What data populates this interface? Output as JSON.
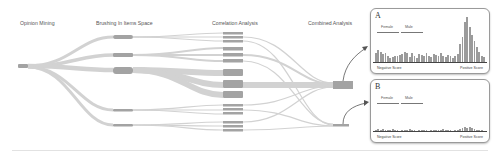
{
  "stages": [
    {
      "label": "Opinion Mining",
      "x": 20
    },
    {
      "label": "Brushing In Items Space",
      "x": 96
    },
    {
      "label": "Correlation Analysis",
      "x": 212
    },
    {
      "label": "Combined Analysis",
      "x": 308
    }
  ],
  "colors": {
    "flow": "#d2d2d2",
    "node": "#a3a3a3",
    "bar": "#9b9b9b",
    "axis": "#444444",
    "arrow": "#555555"
  },
  "panels": [
    {
      "id": "A",
      "letter": "A",
      "legend": {
        "female": "Female",
        "male": "Male"
      },
      "axis": {
        "negative": "Negative Score",
        "positive": "Positive Score"
      },
      "bars": [
        14,
        18,
        15,
        12,
        13,
        9,
        7,
        8,
        10,
        9,
        11,
        12,
        15,
        13,
        8,
        14,
        9,
        7,
        12,
        11,
        10,
        13,
        9,
        8,
        12,
        11,
        10,
        13,
        9,
        8,
        11,
        10,
        7,
        9,
        12,
        25,
        35,
        55,
        62,
        48,
        38,
        30,
        22,
        15,
        10,
        8
      ]
    },
    {
      "id": "B",
      "letter": "B",
      "legend": {
        "female": "Female",
        "male": "Male"
      },
      "axis": {
        "negative": "Negative Score",
        "positive": "Positive Score"
      },
      "bars": [
        7,
        9,
        6,
        8,
        7,
        5,
        6,
        8,
        6,
        5,
        4,
        6,
        7,
        5,
        8,
        6,
        5,
        4,
        7,
        6,
        5,
        6,
        4,
        5,
        7,
        6,
        5,
        6,
        8,
        7,
        5,
        6,
        4,
        5,
        6,
        9,
        12,
        14,
        11,
        15,
        12,
        9,
        7,
        6,
        5,
        4
      ]
    }
  ],
  "chart_data": [
    {
      "type": "bar",
      "title": "A",
      "xlabel": "Negative Score ↔ Positive Score",
      "legend": [
        "Female",
        "Male"
      ],
      "values": [
        14,
        18,
        15,
        12,
        13,
        9,
        7,
        8,
        10,
        9,
        11,
        12,
        15,
        13,
        8,
        14,
        9,
        7,
        12,
        11,
        10,
        13,
        9,
        8,
        12,
        11,
        10,
        13,
        9,
        8,
        11,
        10,
        7,
        9,
        12,
        25,
        35,
        55,
        62,
        48,
        38,
        30,
        22,
        15,
        10,
        8
      ]
    },
    {
      "type": "bar",
      "title": "B",
      "xlabel": "Negative Score ↔ Positive Score",
      "legend": [
        "Female",
        "Male"
      ],
      "values": [
        7,
        9,
        6,
        8,
        7,
        5,
        6,
        8,
        6,
        5,
        4,
        6,
        7,
        5,
        8,
        6,
        5,
        4,
        7,
        6,
        5,
        6,
        4,
        5,
        7,
        6,
        5,
        6,
        8,
        7,
        5,
        6,
        4,
        5,
        6,
        9,
        12,
        14,
        11,
        15,
        12,
        9,
        7,
        6,
        5,
        4
      ]
    }
  ]
}
